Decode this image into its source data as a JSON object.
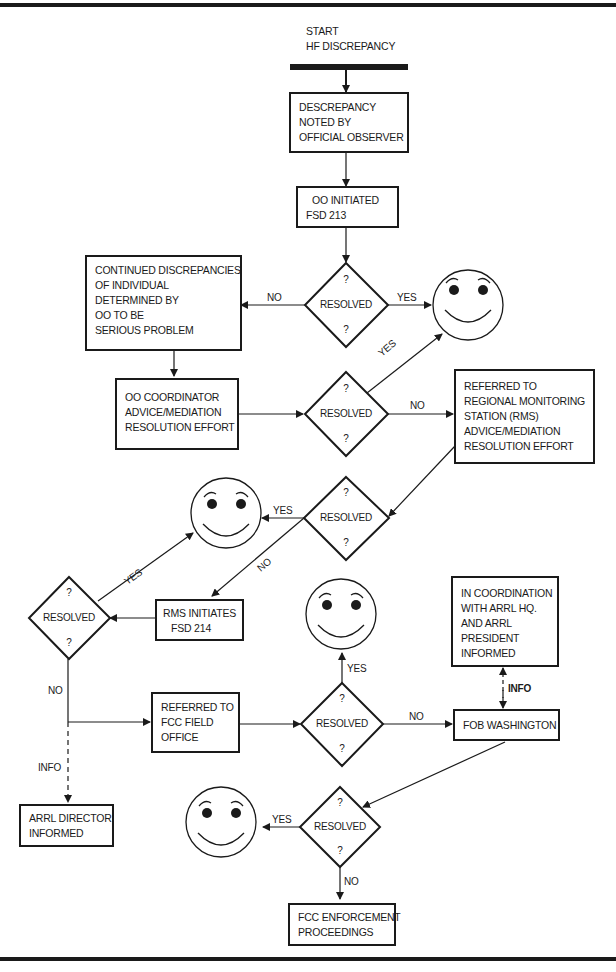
{
  "start": {
    "line1": "START",
    "line2": "HF DISCREPANCY"
  },
  "boxes": {
    "noted": [
      "DESCREPANCY",
      "NOTED BY",
      "OFFICIAL OBSERVER"
    ],
    "oo_initiated": [
      "OO INITIATED",
      "FSD 213"
    ],
    "continued": [
      "CONTINUED DISCREPANCIES",
      "OF INDIVIDUAL",
      "DETERMINED BY",
      "OO TO BE",
      "SERIOUS PROBLEM"
    ],
    "oo_coordinator": [
      "OO COORDINATOR",
      "ADVICE/MEDIATION",
      "RESOLUTION EFFORT"
    ],
    "rms_referred": [
      "REFERRED TO",
      "REGIONAL MONITORING",
      "STATION (RMS)",
      "ADVICE/MEDIATION",
      "RESOLUTION EFFORT"
    ],
    "rms_initiates": [
      "RMS INITIATES",
      "FSD 214"
    ],
    "arrl_hq": [
      "IN COORDINATION",
      "WITH ARRL HQ.",
      "AND ARRL",
      "PRESIDENT",
      "INFORMED"
    ],
    "fcc_field": [
      "REFERRED TO",
      "FCC FIELD",
      "OFFICE"
    ],
    "fob": [
      "FOB WASHINGTON"
    ],
    "arrl_director": [
      "ARRL DIRECTOR",
      "INFORMED"
    ],
    "enforcement": [
      "FCC ENFORCEMENT",
      "PROCEEDINGS"
    ]
  },
  "decision": {
    "label": "RESOLVED",
    "mark": "?"
  },
  "edge_labels": {
    "yes": "YES",
    "no": "NO",
    "info": "INFO"
  },
  "icons": {
    "outcome": "smiley-face-icon"
  },
  "colors": {
    "ink": "#1a1a1a",
    "paper": "#ffffff"
  }
}
